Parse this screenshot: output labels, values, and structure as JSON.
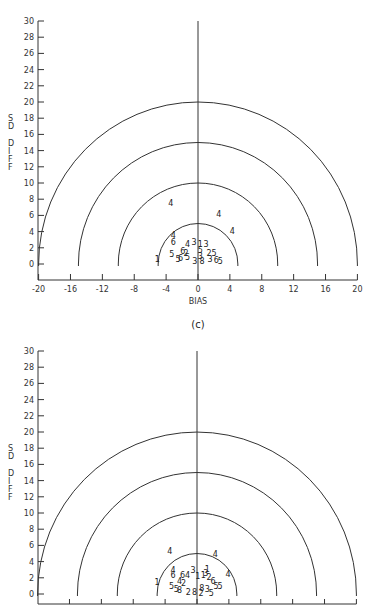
{
  "chart_data": [
    {
      "type": "scatter",
      "panel": "c",
      "caption": "(c)",
      "title": "",
      "xlabel": "BIAS",
      "ylabel": "SD DIFF",
      "xlim": [
        -20,
        20
      ],
      "ylim": [
        0,
        30
      ],
      "x_ticks": [
        -20,
        -16,
        -12,
        -8,
        -4,
        0,
        4,
        8,
        12,
        16,
        20
      ],
      "y_ticks": [
        0,
        2,
        4,
        6,
        8,
        10,
        12,
        14,
        16,
        18,
        20,
        22,
        24,
        26,
        28,
        30
      ],
      "reference_semicircles_radius": [
        5,
        10,
        15,
        20
      ],
      "grid": false,
      "legend": "none (points plotted as numeric symbols 1-8)",
      "points": [
        {
          "label": "4",
          "x": -3.4,
          "y": 7.5
        },
        {
          "label": "4",
          "x": 2.6,
          "y": 6.2
        },
        {
          "label": "4",
          "x": 4.3,
          "y": 4.1
        },
        {
          "label": "4",
          "x": -3.1,
          "y": 3.6
        },
        {
          "label": "6",
          "x": -3.1,
          "y": 2.7
        },
        {
          "label": "4",
          "x": -1.3,
          "y": 2.5
        },
        {
          "label": "3",
          "x": -0.5,
          "y": 2.7
        },
        {
          "label": "1",
          "x": 0.3,
          "y": 2.5
        },
        {
          "label": "3",
          "x": 1.0,
          "y": 2.5
        },
        {
          "label": "1",
          "x": -5.1,
          "y": 0.6
        },
        {
          "label": "5",
          "x": -3.3,
          "y": 1.2
        },
        {
          "label": "5",
          "x": -2.5,
          "y": 0.6
        },
        {
          "label": "6",
          "x": -2.2,
          "y": 0.8
        },
        {
          "label": "6",
          "x": -1.9,
          "y": 1.6
        },
        {
          "label": "2",
          "x": -1.5,
          "y": 1.4
        },
        {
          "label": "5",
          "x": 0.3,
          "y": 1.7
        },
        {
          "label": "2",
          "x": 1.4,
          "y": 1.4
        },
        {
          "label": "5",
          "x": 2.0,
          "y": 1.4
        },
        {
          "label": "3",
          "x": 0.3,
          "y": 1.0
        },
        {
          "label": "5",
          "x": -1.3,
          "y": 0.9
        },
        {
          "label": "3",
          "x": -0.4,
          "y": 0.4
        },
        {
          "label": "8",
          "x": 0.5,
          "y": 0.4
        },
        {
          "label": "3",
          "x": 1.5,
          "y": 0.6
        },
        {
          "label": "6",
          "x": 2.3,
          "y": 0.5
        },
        {
          "label": "5",
          "x": 2.8,
          "y": 0.4
        }
      ]
    },
    {
      "type": "scatter",
      "panel": "d",
      "caption": "",
      "title": "",
      "xlabel": "",
      "ylabel": "SD DIFF",
      "xlim": [
        -20,
        20
      ],
      "ylim": [
        0,
        30
      ],
      "y_ticks": [
        0,
        2,
        4,
        6,
        8,
        10,
        12,
        14,
        16,
        18,
        20,
        22,
        24,
        26,
        28,
        30
      ],
      "reference_semicircles_radius": [
        5,
        10,
        15,
        20
      ],
      "grid": false,
      "legend": "none (points plotted as numeric symbols 1-8)",
      "points": [
        {
          "label": "4",
          "x": -3.4,
          "y": 5.3
        },
        {
          "label": "4",
          "x": 2.3,
          "y": 4.9
        },
        {
          "label": "4",
          "x": 3.9,
          "y": 2.5
        },
        {
          "label": "4",
          "x": -3.0,
          "y": 3.0
        },
        {
          "label": "6",
          "x": -3.0,
          "y": 2.4
        },
        {
          "label": "6",
          "x": -1.8,
          "y": 2.4
        },
        {
          "label": "4",
          "x": -1.2,
          "y": 2.4
        },
        {
          "label": "3",
          "x": -0.5,
          "y": 3.0
        },
        {
          "label": "1",
          "x": 1.3,
          "y": 3.1
        },
        {
          "label": "1",
          "x": 0.1,
          "y": 2.2
        },
        {
          "label": "1",
          "x": 0.8,
          "y": 2.3
        },
        {
          "label": "3",
          "x": 1.1,
          "y": 2.6
        },
        {
          "label": "2",
          "x": 1.5,
          "y": 2.1
        },
        {
          "label": "6",
          "x": 2.0,
          "y": 1.6
        },
        {
          "label": "1",
          "x": -5.0,
          "y": 1.5
        },
        {
          "label": "4",
          "x": -2.2,
          "y": 1.6
        },
        {
          "label": "2",
          "x": -1.7,
          "y": 1.3
        },
        {
          "label": "5",
          "x": -3.2,
          "y": 1.0
        },
        {
          "label": "5",
          "x": -2.6,
          "y": 0.6
        },
        {
          "label": "5",
          "x": 2.4,
          "y": 1.0
        },
        {
          "label": "5",
          "x": 2.9,
          "y": 1.0
        },
        {
          "label": "8",
          "x": -2.2,
          "y": 0.5
        },
        {
          "label": "2",
          "x": -1.1,
          "y": 0.3
        },
        {
          "label": "8",
          "x": -0.3,
          "y": 0.3
        },
        {
          "label": "8",
          "x": 0.6,
          "y": 0.7
        },
        {
          "label": "3",
          "x": 1.3,
          "y": 0.6
        },
        {
          "label": "2",
          "x": 0.5,
          "y": 0.1
        },
        {
          "label": "5",
          "x": 1.8,
          "y": 0.1
        }
      ]
    }
  ]
}
